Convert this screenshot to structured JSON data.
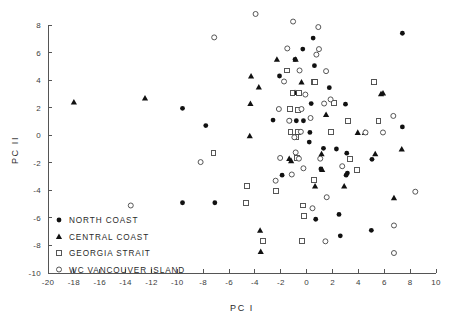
{
  "chart_data": {
    "type": "scatter",
    "title": "",
    "xlabel": "PC I",
    "ylabel": "PC II",
    "xlim": [
      -20,
      10
    ],
    "ylim": [
      -10,
      8
    ],
    "xticks": [
      -20,
      -18,
      -16,
      -14,
      -12,
      -10,
      -8,
      -6,
      -4,
      -2,
      0,
      2,
      4,
      6,
      8,
      10
    ],
    "yticks": [
      -10,
      -8,
      -6,
      -4,
      -2,
      0,
      2,
      4,
      6,
      8
    ],
    "xtick_labels": [
      "-20",
      "-18",
      "-16",
      "-14",
      "-12",
      "-10",
      "-8",
      "-6",
      "-4",
      "-2",
      "0",
      "2",
      "4",
      "6",
      "8",
      "10"
    ],
    "ytick_labels": [
      "-10",
      "-8",
      "-6",
      "-4",
      "-2",
      "0",
      "2",
      "4",
      "6",
      "8"
    ],
    "grid": false,
    "legend_position": "lower-left-inside",
    "series": [
      {
        "name": "NORTH COAST",
        "marker": "filled-circle",
        "color": "#111111",
        "points": [
          [
            -9.6,
            1.95
          ],
          [
            -7.8,
            0.7
          ],
          [
            -9.6,
            -4.9
          ],
          [
            -7.1,
            -4.9
          ],
          [
            -2.6,
            1.1
          ],
          [
            -2.1,
            4.3
          ],
          [
            -1.9,
            -2.9
          ],
          [
            -1.3,
            1.05
          ],
          [
            -0.9,
            5.5
          ],
          [
            -0.8,
            1.05
          ],
          [
            -0.3,
            6.25
          ],
          [
            -0.25,
            1.05
          ],
          [
            0.2,
            -0.5
          ],
          [
            0.35,
            2.3
          ],
          [
            0.5,
            7.05
          ],
          [
            0.6,
            5.05
          ],
          [
            0.25,
            0.2
          ],
          [
            0.7,
            -6.1
          ],
          [
            1.1,
            -2.45
          ],
          [
            1.3,
            -0.95
          ],
          [
            1.75,
            3.45
          ],
          [
            2.3,
            -1.0
          ],
          [
            2.6,
            -7.3
          ],
          [
            2.5,
            -5.75
          ],
          [
            3.05,
            -2.9
          ],
          [
            3.1,
            -1.3
          ],
          [
            3.0,
            2.25
          ],
          [
            3.15,
            -2.75
          ],
          [
            5.0,
            -6.9
          ],
          [
            5.05,
            -1.75
          ],
          [
            7.4,
            7.4
          ],
          [
            7.4,
            0.6
          ]
        ]
      },
      {
        "name": "CENTRAL COAST",
        "marker": "filled-triangle",
        "color": "#111111",
        "points": [
          [
            -18.0,
            2.4
          ],
          [
            -12.5,
            2.7
          ],
          [
            -4.3,
            4.3
          ],
          [
            -4.35,
            2.3
          ],
          [
            -4.4,
            -0.05
          ],
          [
            -3.7,
            3.5
          ],
          [
            -3.6,
            -6.9
          ],
          [
            -3.55,
            -8.45
          ],
          [
            -2.3,
            5.5
          ],
          [
            -1.35,
            -1.7
          ],
          [
            -1.2,
            -1.85
          ],
          [
            -0.85,
            5.5
          ],
          [
            -0.9,
            3.1
          ],
          [
            -0.4,
            3.85
          ],
          [
            0.6,
            3.85
          ],
          [
            0.65,
            -3.7
          ],
          [
            1.2,
            -2.5
          ],
          [
            1.15,
            -1.35
          ],
          [
            1.5,
            1.5
          ],
          [
            2.9,
            -3.7
          ],
          [
            3.95,
            0.2
          ],
          [
            4.5,
            0.2
          ],
          [
            5.2,
            3.85
          ],
          [
            5.3,
            -1.35
          ],
          [
            5.75,
            3.0
          ],
          [
            5.9,
            3.05
          ],
          [
            6.75,
            -4.55
          ],
          [
            7.35,
            -1.0
          ]
        ]
      },
      {
        "name": "GEORGIA STRAIT",
        "marker": "open-square",
        "color": "#444444",
        "points": [
          [
            -7.2,
            -1.3
          ],
          [
            -4.6,
            -3.7
          ],
          [
            -4.7,
            -4.9
          ],
          [
            -3.4,
            -7.65
          ],
          [
            -2.4,
            -4.05
          ],
          [
            -1.5,
            4.7
          ],
          [
            -1.1,
            3.05
          ],
          [
            -1.3,
            1.9
          ],
          [
            -1.25,
            0.25
          ],
          [
            -0.85,
            -0.15
          ],
          [
            -0.6,
            3.05
          ],
          [
            -0.65,
            1.85
          ],
          [
            -0.7,
            0.25
          ],
          [
            -0.75,
            -1.65
          ],
          [
            -0.35,
            -7.65
          ],
          [
            -0.2,
            -5.85
          ],
          [
            -0.3,
            -5.1
          ],
          [
            0.55,
            3.85
          ],
          [
            0.65,
            3.85
          ],
          [
            0.55,
            -3.25
          ],
          [
            1.9,
            0.25
          ],
          [
            2.1,
            2.35
          ],
          [
            3.2,
            1.05
          ],
          [
            3.35,
            -1.7
          ],
          [
            3.9,
            -2.5
          ],
          [
            5.2,
            3.85
          ],
          [
            5.55,
            1.05
          ]
        ]
      },
      {
        "name": "WC VANCOUVER ISLAND",
        "marker": "open-circle",
        "color": "#444444",
        "points": [
          [
            -13.6,
            -5.1
          ],
          [
            -8.2,
            -1.95
          ],
          [
            -7.15,
            7.1
          ],
          [
            -3.95,
            8.8
          ],
          [
            -2.4,
            -3.3
          ],
          [
            -2.15,
            1.9
          ],
          [
            -2.05,
            -1.65
          ],
          [
            -1.75,
            3.9
          ],
          [
            -1.5,
            6.3
          ],
          [
            -1.35,
            1.05
          ],
          [
            -1.15,
            -2.85
          ],
          [
            -1.05,
            8.25
          ],
          [
            -0.95,
            -0.15
          ],
          [
            -0.85,
            -1.25
          ],
          [
            -0.6,
            -1.7
          ],
          [
            -0.55,
            4.7
          ],
          [
            -0.4,
            1.9
          ],
          [
            -0.45,
            0.25
          ],
          [
            -0.25,
            -2.4
          ],
          [
            -0.1,
            2.95
          ],
          [
            0.3,
            1.25
          ],
          [
            0.45,
            -5.3
          ],
          [
            0.75,
            5.85
          ],
          [
            0.9,
            7.85
          ],
          [
            0.95,
            6.25
          ],
          [
            1.05,
            -1.7
          ],
          [
            1.35,
            2.3
          ],
          [
            1.5,
            4.65
          ],
          [
            1.45,
            -7.7
          ],
          [
            1.55,
            -4.5
          ],
          [
            1.85,
            2.6
          ],
          [
            2.75,
            -2.25
          ],
          [
            4.55,
            0.2
          ],
          [
            5.9,
            0.2
          ],
          [
            6.7,
            1.4
          ],
          [
            6.75,
            -6.55
          ],
          [
            6.75,
            -8.55
          ],
          [
            8.4,
            -4.1
          ]
        ]
      }
    ]
  },
  "legend": {
    "items": [
      {
        "label": "NORTH  COAST",
        "marker": "filled-circle"
      },
      {
        "label": "CENTRAL  COAST",
        "marker": "filled-triangle"
      },
      {
        "label": "GEORGIA  STRAIT",
        "marker": "open-square"
      },
      {
        "label": "WC  VANCOUVER ISLAND",
        "marker": "open-circle"
      }
    ]
  }
}
